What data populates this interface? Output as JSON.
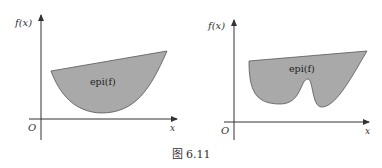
{
  "figures": [
    {
      "id": "convex",
      "y_axis_label": "f(x)",
      "x_axis_label": "x",
      "origin_label": "O",
      "region_label": "epi(f)",
      "fill_color": "#a9a9a9",
      "stroke_color": "#555555"
    },
    {
      "id": "nonconvex",
      "y_axis_label": "f(x)",
      "x_axis_label": "x",
      "origin_label": "O",
      "region_label": "epi(f)",
      "fill_color": "#a9a9a9",
      "stroke_color": "#555555"
    }
  ],
  "caption": "图 6.11"
}
